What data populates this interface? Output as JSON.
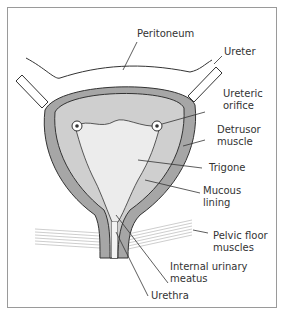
{
  "diagram": {
    "labels": {
      "peritoneum": "Peritoneum",
      "ureter": "Ureter",
      "ureteric_orifice": "Ureteric\norifice",
      "detrusor_muscle": "Detrusor\nmuscle",
      "trigone": "Trigone",
      "mucous_lining": "Mucous\nlining",
      "pelvic_floor_muscles": "Pelvic floor\nmuscles",
      "internal_urinary_meatus": "Internal urinary\nmeatus",
      "urethra": "Urethra"
    },
    "colors": {
      "detrusor": "#a6a6a6",
      "mucosa": "#cfcfcf",
      "trigone": "#ececec",
      "outline": "#333333",
      "pelvic_floor": "#bdbdbd"
    }
  }
}
